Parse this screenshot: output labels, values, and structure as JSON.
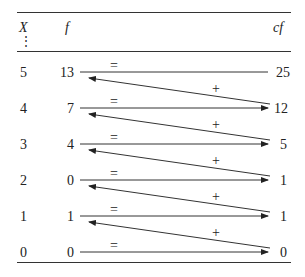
{
  "table": {
    "headers": {
      "x": "X",
      "f": "f",
      "cf": "cf",
      "vdots": "⋮"
    },
    "rows": [
      {
        "x": "5",
        "f": "13",
        "cf": "25"
      },
      {
        "x": "4",
        "f": "7",
        "cf": "12"
      },
      {
        "x": "3",
        "f": "4",
        "cf": "5"
      },
      {
        "x": "2",
        "f": "0",
        "cf": "1"
      },
      {
        "x": "1",
        "f": "1",
        "cf": "1"
      },
      {
        "x": "0",
        "f": "0",
        "cf": "0"
      }
    ],
    "equals_symbol": "=",
    "plus_symbol": "+"
  }
}
